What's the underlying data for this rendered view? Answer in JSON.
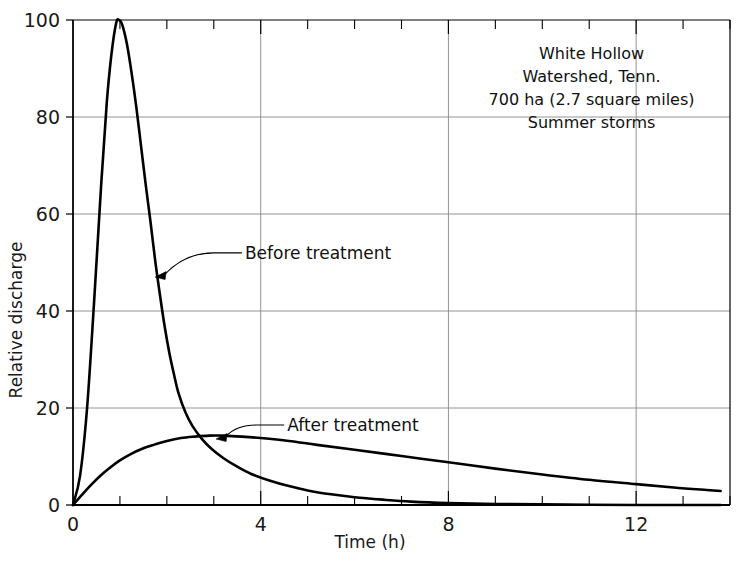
{
  "chart_data": {
    "type": "line",
    "title": "",
    "xlabel": "Time (h)",
    "ylabel": "Relative discharge",
    "xlim": [
      0,
      14
    ],
    "ylim": [
      0,
      100
    ],
    "xticks": [
      0,
      4,
      8,
      12
    ],
    "xticklabels": [
      "0",
      "4",
      "8",
      "12"
    ],
    "xminorticks": [
      1,
      2,
      3,
      5,
      6,
      7,
      9,
      10,
      11,
      13,
      14
    ],
    "yticks": [
      0,
      20,
      40,
      60,
      80,
      100
    ],
    "yticklabels": [
      "0",
      "20",
      "40",
      "60",
      "80",
      "100"
    ],
    "grid": true,
    "grid_axes": "both",
    "legend": "inline-annotations",
    "line_color": "#000000",
    "grid_color": "#888888",
    "axis_color": "#000000",
    "background": "#ffffff",
    "series": [
      {
        "name": "Before treatment",
        "label_x": 3.6,
        "label_y": 52,
        "arrow_tip_x": 1.75,
        "arrow_tip_y": 47,
        "points": [
          [
            0.0,
            0.0
          ],
          [
            0.15,
            6.0
          ],
          [
            0.3,
            20.0
          ],
          [
            0.45,
            42.0
          ],
          [
            0.6,
            66.0
          ],
          [
            0.72,
            83.0
          ],
          [
            0.82,
            93.0
          ],
          [
            0.92,
            99.4
          ],
          [
            0.98,
            100.0
          ],
          [
            1.05,
            99.0
          ],
          [
            1.15,
            95.0
          ],
          [
            1.25,
            89.0
          ],
          [
            1.35,
            82.0
          ],
          [
            1.45,
            74.0
          ],
          [
            1.55,
            66.0
          ],
          [
            1.65,
            58.5
          ],
          [
            1.75,
            50.5
          ],
          [
            1.85,
            43.5
          ],
          [
            1.95,
            37.0
          ],
          [
            2.05,
            31.5
          ],
          [
            2.15,
            27.0
          ],
          [
            2.25,
            23.0
          ],
          [
            2.4,
            19.0
          ],
          [
            2.55,
            16.2
          ],
          [
            2.75,
            13.6
          ],
          [
            2.95,
            11.6
          ],
          [
            3.2,
            9.7
          ],
          [
            3.5,
            7.9
          ],
          [
            3.8,
            6.4
          ],
          [
            4.2,
            5.0
          ],
          [
            4.6,
            3.9
          ],
          [
            5.0,
            3.0
          ],
          [
            5.5,
            2.2
          ],
          [
            6.0,
            1.6
          ],
          [
            6.6,
            1.1
          ],
          [
            7.2,
            0.7
          ],
          [
            8.0,
            0.4
          ],
          [
            9.0,
            0.2
          ],
          [
            10.5,
            0.1
          ],
          [
            12.0,
            0.0
          ],
          [
            13.8,
            0.0
          ]
        ]
      },
      {
        "name": "After treatment",
        "label_x": 4.5,
        "label_y": 16.5,
        "arrow_tip_x": 3.05,
        "arrow_tip_y": 13.6,
        "points": [
          [
            0.0,
            0.0
          ],
          [
            0.2,
            2.2
          ],
          [
            0.4,
            4.3
          ],
          [
            0.6,
            6.2
          ],
          [
            0.8,
            7.8
          ],
          [
            1.0,
            9.2
          ],
          [
            1.25,
            10.6
          ],
          [
            1.5,
            11.7
          ],
          [
            1.75,
            12.5
          ],
          [
            2.0,
            13.2
          ],
          [
            2.3,
            13.8
          ],
          [
            2.6,
            14.1
          ],
          [
            2.9,
            14.3
          ],
          [
            3.2,
            14.3
          ],
          [
            3.6,
            14.1
          ],
          [
            4.0,
            13.8
          ],
          [
            4.6,
            13.2
          ],
          [
            5.2,
            12.4
          ],
          [
            6.0,
            11.4
          ],
          [
            7.0,
            10.1
          ],
          [
            8.0,
            8.8
          ],
          [
            9.0,
            7.5
          ],
          [
            10.0,
            6.3
          ],
          [
            11.0,
            5.2
          ],
          [
            12.0,
            4.3
          ],
          [
            12.8,
            3.6
          ],
          [
            13.5,
            3.1
          ],
          [
            13.8,
            2.9
          ]
        ]
      }
    ],
    "annotation": {
      "lines": [
        "White Hollow",
        "Watershed, Tenn.",
        "700 ha (2.7 square miles)",
        "Summer storms"
      ],
      "x": 11.05,
      "y": 92
    }
  }
}
